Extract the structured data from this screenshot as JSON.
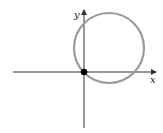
{
  "diagram": {
    "x_axis_label": "x",
    "y_axis_label": "y",
    "colors": {
      "axis": "#333333",
      "circle": "#9a9a9a",
      "point": "#000000"
    },
    "circle": {
      "cx": 109,
      "cy": 48,
      "r": 35
    },
    "origin_point": {
      "cx": 84,
      "cy": 72
    }
  }
}
